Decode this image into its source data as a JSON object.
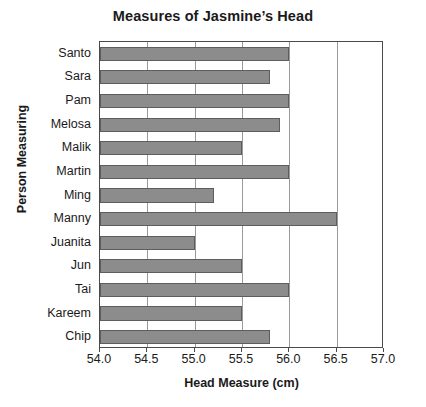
{
  "chart_data": {
    "type": "bar",
    "orientation": "horizontal",
    "title": "Measures of Jasmine’s Head",
    "xlabel": "Head Measure (cm)",
    "ylabel": "Person Measuring",
    "categories": [
      "Santo",
      "Sara",
      "Pam",
      "Melosa",
      "Malik",
      "Martin",
      "Ming",
      "Manny",
      "Juanita",
      "Jun",
      "Tai",
      "Kareem",
      "Chip"
    ],
    "values": [
      56.0,
      55.8,
      56.0,
      55.9,
      55.5,
      56.0,
      55.2,
      56.5,
      55.0,
      55.5,
      56.0,
      55.5,
      55.8
    ],
    "xlim": [
      54.0,
      57.0
    ],
    "xticks": [
      "54.0",
      "54.5",
      "55.0",
      "55.5",
      "56.0",
      "56.5",
      "57.0"
    ],
    "xtick_values": [
      54.0,
      54.5,
      55.0,
      55.5,
      56.0,
      56.5,
      57.0
    ],
    "grid": "vertical",
    "legend": "none",
    "bar_color": "#8c8c8c",
    "bar_edge_color": "#5d5d5d",
    "axis_color": "#4a4a4a",
    "grid_color": "#9a9a9a",
    "background": "#ffffff"
  }
}
